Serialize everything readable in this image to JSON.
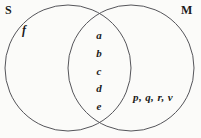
{
  "diagram": {
    "type": "venn-two-set",
    "background_color": "#fbfbf9",
    "stroke_color": "#55555a",
    "sets": {
      "left": {
        "label": "S"
      },
      "right": {
        "label": "M"
      }
    },
    "regions": {
      "left_only": {
        "name": "S only",
        "members": [
          "f"
        ]
      },
      "intersection": {
        "name": "S and M",
        "members": [
          "a",
          "b",
          "c",
          "d",
          "e"
        ]
      },
      "right_only": {
        "name": "M only",
        "members_text": "p, q, r, v",
        "members": [
          "p",
          "q",
          "r",
          "v"
        ]
      }
    },
    "geometry": {
      "left_circle": {
        "cx": 68,
        "cy": 68,
        "r": 63
      },
      "right_circle": {
        "cx": 131,
        "cy": 68,
        "r": 63
      }
    }
  }
}
